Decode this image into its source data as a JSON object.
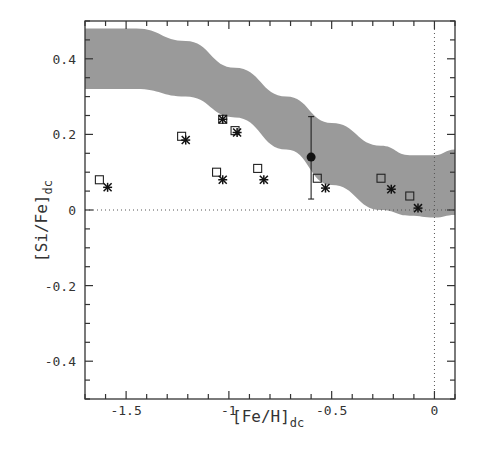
{
  "chart_data": {
    "type": "scatter",
    "title": "",
    "xlabel": "[Fe/H]",
    "xlabel_subscript": "dc",
    "ylabel": "[Si/Fe]",
    "ylabel_subscript": "dc",
    "xlim": [
      -1.7,
      0.1
    ],
    "ylim": [
      -0.5,
      0.5
    ],
    "x_ticks": [
      -1.5,
      -1,
      -0.5,
      0
    ],
    "x_tick_labels": [
      "-1.5",
      "-1",
      "-0.5",
      "0"
    ],
    "y_ticks": [
      0.4,
      0.2,
      0,
      -0.2,
      -0.4
    ],
    "y_tick_labels": [
      "0.4",
      "0.2",
      "0",
      "-0.2",
      "-0.4"
    ],
    "x_minor_step": 0.1,
    "y_minor_step": 0.05,
    "grid": false,
    "legend": null,
    "reference_lines": [
      {
        "orientation": "horizontal",
        "value": 0,
        "style": "dotted"
      },
      {
        "orientation": "vertical",
        "value": 0,
        "style": "dotted"
      }
    ],
    "band": {
      "name": "model range",
      "color": "#9a9a9a",
      "x": [
        -1.7,
        -1.45,
        -1.21,
        -0.97,
        -0.72,
        -0.5,
        -0.26,
        -0.12,
        0.0,
        0.1
      ],
      "upper": [
        0.48,
        0.48,
        0.447,
        0.376,
        0.3,
        0.23,
        0.17,
        0.145,
        0.145,
        0.16
      ],
      "lower": [
        0.32,
        0.32,
        0.3,
        0.245,
        0.16,
        0.066,
        0.0,
        -0.015,
        -0.02,
        -0.013
      ]
    },
    "series": [
      {
        "name": "open squares",
        "marker": "square-open",
        "points": [
          {
            "x": -1.63,
            "y": 0.08
          },
          {
            "x": -1.23,
            "y": 0.195
          },
          {
            "x": -1.06,
            "y": 0.1
          },
          {
            "x": -1.03,
            "y": 0.24
          },
          {
            "x": -0.97,
            "y": 0.21
          },
          {
            "x": -0.86,
            "y": 0.11
          },
          {
            "x": -0.57,
            "y": 0.084
          },
          {
            "x": -0.26,
            "y": 0.084
          },
          {
            "x": -0.12,
            "y": 0.037
          }
        ]
      },
      {
        "name": "asterisks",
        "marker": "asterisk",
        "points": [
          {
            "x": -1.59,
            "y": 0.06
          },
          {
            "x": -1.21,
            "y": 0.185
          },
          {
            "x": -1.03,
            "y": 0.08
          },
          {
            "x": -1.03,
            "y": 0.24
          },
          {
            "x": -0.96,
            "y": 0.205
          },
          {
            "x": -0.83,
            "y": 0.08
          },
          {
            "x": -0.53,
            "y": 0.058
          },
          {
            "x": -0.21,
            "y": 0.055
          },
          {
            "x": -0.08,
            "y": 0.005
          }
        ]
      },
      {
        "name": "filled circle with error bar",
        "marker": "circle-filled",
        "points": [
          {
            "x": -0.6,
            "y": 0.14,
            "y_err_low": 0.029,
            "y_err_high": 0.247
          }
        ]
      }
    ]
  }
}
